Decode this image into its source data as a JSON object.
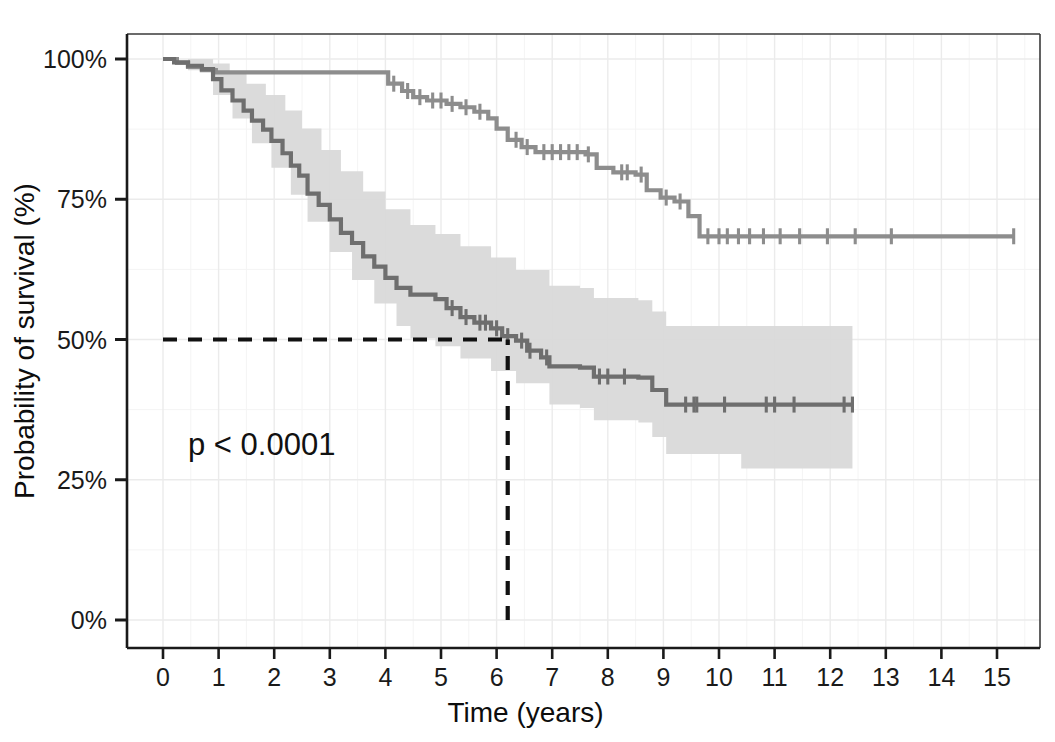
{
  "chart_data": {
    "type": "line",
    "subtype": "kaplan-meier-survival",
    "title": "",
    "xlabel": "Time (years)",
    "ylabel": "Probability of survival (%)",
    "xlim": [
      0,
      15.6
    ],
    "ylim": [
      0,
      100
    ],
    "xticks": [
      0,
      1,
      2,
      3,
      4,
      5,
      6,
      7,
      8,
      9,
      10,
      11,
      12,
      13,
      14,
      15
    ],
    "xtick_labels": [
      "0",
      "1",
      "2",
      "3",
      "4",
      "5",
      "6",
      "7",
      "8",
      "9",
      "10",
      "11",
      "12",
      "13",
      "14",
      "15"
    ],
    "yticks": [
      0,
      25,
      50,
      75,
      100
    ],
    "ytick_labels": [
      "0%",
      "25%",
      "50%",
      "75%",
      "100%"
    ],
    "grid": true,
    "grid_minor": true,
    "legend": "none",
    "annotations": [
      {
        "name": "p-value",
        "text": "p < 0.0001",
        "x": 0.45,
        "y": 29.5
      }
    ],
    "reference_lines": [
      {
        "name": "median-survival-horizontal",
        "orientation": "horizontal",
        "value": 50,
        "x_from": 0,
        "x_to": 6.2,
        "style": "dashed"
      },
      {
        "name": "median-survival-vertical",
        "orientation": "vertical",
        "value": 6.2,
        "y_from": 0,
        "y_to": 50,
        "style": "dashed"
      }
    ],
    "median_survival_years": 6.2,
    "series": [
      {
        "name": "upper-group",
        "color": "#8d8d8d",
        "band_color": "#d9d9d9",
        "steps": [
          [
            0.0,
            100.0
          ],
          [
            0.25,
            99.3
          ],
          [
            0.45,
            98.6
          ],
          [
            0.7,
            98.0
          ],
          [
            0.95,
            97.6
          ],
          [
            3.85,
            97.6
          ],
          [
            4.05,
            95.6
          ],
          [
            4.3,
            94.3
          ],
          [
            4.5,
            93.2
          ],
          [
            4.75,
            92.6
          ],
          [
            5.1,
            92.0
          ],
          [
            5.35,
            91.4
          ],
          [
            5.6,
            90.6
          ],
          [
            5.85,
            89.4
          ],
          [
            6.0,
            87.6
          ],
          [
            6.2,
            85.6
          ],
          [
            6.45,
            84.3
          ],
          [
            6.7,
            83.4
          ],
          [
            7.6,
            83.0
          ],
          [
            7.8,
            80.6
          ],
          [
            8.1,
            79.8
          ],
          [
            8.5,
            79.4
          ],
          [
            8.7,
            76.6
          ],
          [
            8.95,
            75.3
          ],
          [
            9.2,
            74.6
          ],
          [
            9.45,
            72.0
          ],
          [
            9.65,
            68.4
          ],
          [
            15.3,
            68.4
          ]
        ],
        "censor_marks": [
          4.15,
          4.4,
          4.62,
          4.85,
          5.0,
          5.2,
          5.45,
          5.7,
          6.35,
          6.55,
          6.85,
          7.0,
          7.15,
          7.3,
          7.45,
          7.65,
          8.25,
          8.35,
          8.6,
          9.05,
          9.3,
          9.8,
          10.0,
          10.15,
          10.35,
          10.55,
          10.8,
          11.1,
          11.45,
          11.95,
          12.45,
          13.1,
          15.3
        ]
      },
      {
        "name": "lower-group",
        "color": "#6e6e6e",
        "band_color": "#d9d9d9",
        "steps": [
          [
            0.0,
            100.0
          ],
          [
            0.2,
            99.4
          ],
          [
            0.45,
            98.8
          ],
          [
            0.7,
            98.2
          ],
          [
            0.9,
            96.4
          ],
          [
            1.05,
            94.4
          ],
          [
            1.25,
            92.6
          ],
          [
            1.45,
            90.8
          ],
          [
            1.6,
            89.0
          ],
          [
            1.8,
            87.4
          ],
          [
            1.95,
            85.4
          ],
          [
            2.15,
            83.2
          ],
          [
            2.3,
            81.0
          ],
          [
            2.45,
            79.2
          ],
          [
            2.6,
            76.0
          ],
          [
            2.8,
            74.0
          ],
          [
            3.0,
            71.4
          ],
          [
            3.2,
            69.0
          ],
          [
            3.4,
            67.2
          ],
          [
            3.6,
            64.8
          ],
          [
            3.8,
            63.0
          ],
          [
            4.0,
            61.0
          ],
          [
            4.2,
            59.2
          ],
          [
            4.45,
            58.0
          ],
          [
            4.9,
            57.2
          ],
          [
            5.1,
            55.6
          ],
          [
            5.35,
            54.0
          ],
          [
            5.6,
            53.0
          ],
          [
            5.9,
            52.0
          ],
          [
            6.1,
            50.6
          ],
          [
            6.35,
            49.8
          ],
          [
            6.55,
            48.0
          ],
          [
            6.8,
            46.8
          ],
          [
            6.95,
            45.2
          ],
          [
            7.5,
            45.0
          ],
          [
            7.75,
            43.4
          ],
          [
            8.55,
            43.2
          ],
          [
            8.8,
            41.0
          ],
          [
            9.05,
            38.4
          ],
          [
            12.4,
            38.4
          ]
        ],
        "censor_marks": [
          5.2,
          5.45,
          5.7,
          5.8,
          6.0,
          6.2,
          6.45,
          6.6,
          6.9,
          7.85,
          8.0,
          8.3,
          9.4,
          9.55,
          9.6,
          10.1,
          10.85,
          11.0,
          11.35,
          12.25,
          12.4
        ]
      }
    ],
    "confidence_bands": [
      {
        "name": "upper-group-ci",
        "visible": false
      },
      {
        "name": "lower-group-ci",
        "visible": true,
        "upper_steps": [
          [
            0.0,
            100.0
          ],
          [
            0.5,
            100.0
          ],
          [
            0.9,
            99.2
          ],
          [
            1.2,
            97.4
          ],
          [
            1.5,
            95.6
          ],
          [
            1.85,
            93.6
          ],
          [
            2.2,
            90.8
          ],
          [
            2.5,
            87.6
          ],
          [
            2.85,
            83.8
          ],
          [
            3.2,
            80.0
          ],
          [
            3.6,
            76.4
          ],
          [
            4.0,
            73.2
          ],
          [
            4.45,
            70.4
          ],
          [
            4.9,
            68.8
          ],
          [
            5.35,
            66.6
          ],
          [
            5.9,
            64.6
          ],
          [
            6.35,
            62.4
          ],
          [
            6.95,
            59.6
          ],
          [
            7.5,
            59.2
          ],
          [
            7.75,
            57.4
          ],
          [
            8.55,
            57.0
          ],
          [
            8.8,
            55.0
          ],
          [
            9.05,
            52.4
          ],
          [
            12.4,
            52.4
          ]
        ],
        "lower_steps": [
          [
            0.0,
            100.0
          ],
          [
            0.45,
            98.0
          ],
          [
            0.9,
            93.6
          ],
          [
            1.25,
            89.4
          ],
          [
            1.6,
            85.0
          ],
          [
            1.95,
            80.6
          ],
          [
            2.3,
            75.8
          ],
          [
            2.6,
            71.0
          ],
          [
            3.0,
            65.6
          ],
          [
            3.4,
            60.6
          ],
          [
            3.8,
            56.4
          ],
          [
            4.2,
            52.4
          ],
          [
            4.45,
            50.2
          ],
          [
            4.9,
            48.8
          ],
          [
            5.35,
            46.6
          ],
          [
            5.9,
            44.4
          ],
          [
            6.35,
            42.2
          ],
          [
            6.95,
            38.4
          ],
          [
            7.5,
            37.8
          ],
          [
            7.75,
            35.6
          ],
          [
            8.55,
            35.2
          ],
          [
            8.8,
            32.6
          ],
          [
            9.05,
            29.6
          ],
          [
            10.4,
            29.6
          ],
          [
            10.4,
            27.0
          ],
          [
            12.4,
            27.0
          ]
        ]
      }
    ]
  },
  "axes": {
    "x_title": "Time (years)",
    "y_title": "Probability of survival (%)",
    "x_tick_labels": [
      "0",
      "1",
      "2",
      "3",
      "4",
      "5",
      "6",
      "7",
      "8",
      "9",
      "10",
      "11",
      "12",
      "13",
      "14",
      "15"
    ],
    "y_tick_labels": [
      "0%",
      "25%",
      "50%",
      "75%",
      "100%"
    ]
  },
  "annotations": {
    "p_value": "p < 0.0001"
  },
  "colors": {
    "upper_curve": "#8d8d8d",
    "lower_curve": "#6e6e6e",
    "confidence_band": "#d9d9d9",
    "axis": "#1a1a1a",
    "grid_major": "#ebebeb",
    "grid_minor": "#f4f4f4",
    "dashed_reference": "#111111",
    "background": "#ffffff"
  }
}
